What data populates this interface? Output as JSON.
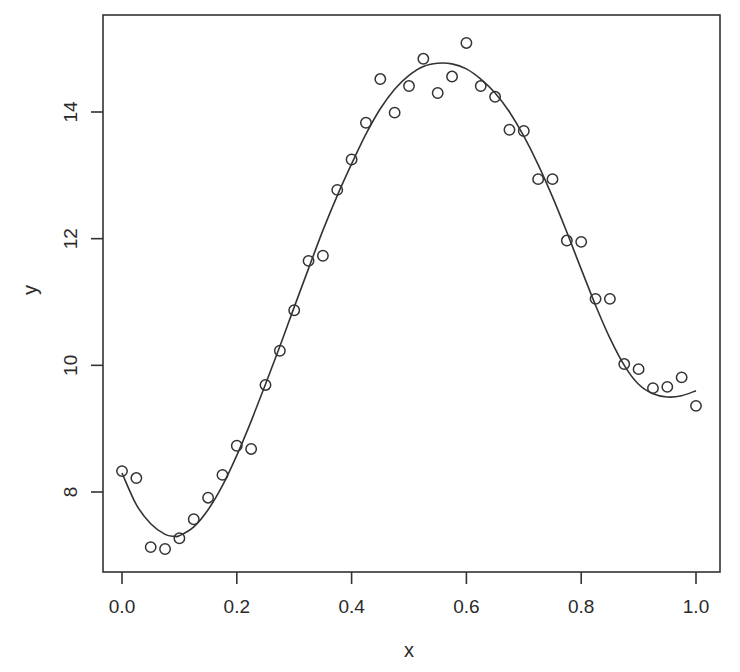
{
  "chart_data": {
    "type": "scatter",
    "title": "",
    "xlabel": "x",
    "ylabel": "y",
    "xlim": [
      -0.035,
      1.04
    ],
    "ylim": [
      6.75,
      15.45
    ],
    "grid": false,
    "legend": null,
    "x_ticks": [
      0.0,
      0.2,
      0.4,
      0.6,
      0.8,
      1.0
    ],
    "x_tick_labels": [
      "0.0",
      "0.2",
      "0.4",
      "0.6",
      "0.8",
      "1.0"
    ],
    "y_ticks": [
      8,
      10,
      12,
      14
    ],
    "y_tick_labels": [
      "8",
      "10",
      "12",
      "14"
    ],
    "series": [
      {
        "name": "observations",
        "kind": "points",
        "marker": "open-circle",
        "x": [
          0.0,
          0.025,
          0.05,
          0.075,
          0.1,
          0.125,
          0.15,
          0.175,
          0.2,
          0.225,
          0.25,
          0.275,
          0.3,
          0.325,
          0.35,
          0.375,
          0.4,
          0.425,
          0.45,
          0.475,
          0.5,
          0.525,
          0.55,
          0.575,
          0.6,
          0.625,
          0.65,
          0.675,
          0.7,
          0.725,
          0.75,
          0.775,
          0.8,
          0.825,
          0.85,
          0.875,
          0.9,
          0.925,
          0.95,
          0.975,
          1.0
        ],
        "y": [
          8.33,
          8.22,
          7.13,
          7.1,
          7.27,
          7.57,
          7.91,
          8.27,
          8.73,
          8.68,
          9.69,
          10.23,
          10.87,
          11.65,
          11.73,
          12.77,
          13.25,
          13.83,
          14.52,
          13.99,
          14.41,
          14.84,
          14.3,
          14.56,
          15.09,
          14.41,
          14.24,
          13.72,
          13.7,
          12.94,
          12.94,
          11.97,
          11.95,
          11.05,
          11.05,
          10.02,
          9.94,
          9.64,
          9.66,
          9.81,
          9.36
        ]
      },
      {
        "name": "smooth fit",
        "kind": "line",
        "x": [
          0.0,
          0.025,
          0.05,
          0.075,
          0.09,
          0.1,
          0.125,
          0.15,
          0.175,
          0.2,
          0.225,
          0.25,
          0.275,
          0.3,
          0.325,
          0.35,
          0.375,
          0.4,
          0.425,
          0.45,
          0.475,
          0.5,
          0.525,
          0.55,
          0.575,
          0.6,
          0.625,
          0.65,
          0.675,
          0.7,
          0.725,
          0.75,
          0.775,
          0.8,
          0.825,
          0.85,
          0.875,
          0.9,
          0.925,
          0.95,
          0.975,
          1.0
        ],
        "y": [
          8.3,
          7.8,
          7.5,
          7.33,
          7.3,
          7.31,
          7.45,
          7.72,
          8.1,
          8.58,
          9.12,
          9.7,
          10.3,
          10.92,
          11.53,
          12.13,
          12.68,
          13.18,
          13.65,
          14.05,
          14.36,
          14.58,
          14.72,
          14.77,
          14.76,
          14.68,
          14.52,
          14.3,
          14.0,
          13.62,
          13.17,
          12.66,
          12.1,
          11.52,
          10.95,
          10.43,
          10.0,
          9.7,
          9.55,
          9.5,
          9.52,
          9.6
        ]
      }
    ]
  },
  "plot": {
    "x_axis_label": "x",
    "y_axis_label": "y"
  }
}
